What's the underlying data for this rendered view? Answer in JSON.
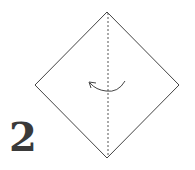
{
  "diagram": {
    "step_number": "2",
    "shape": "diamond",
    "fold_line": "vertical-dashed-valley",
    "arrow": "curved-fold-arrow-right-to-left",
    "colors": {
      "line": "#444444",
      "dashed": "#555555",
      "number": "#3a3a3a",
      "background": "#ffffff"
    }
  }
}
